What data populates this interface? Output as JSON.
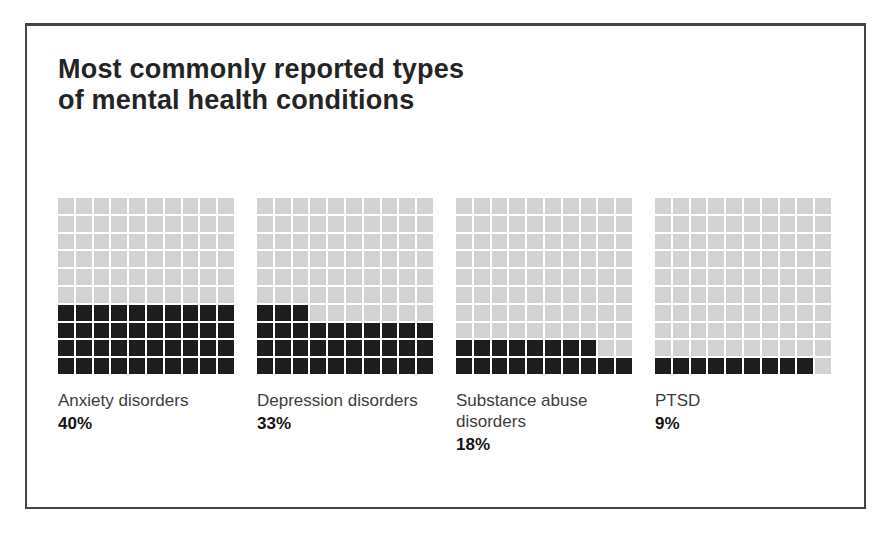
{
  "title": {
    "line1": "Most commonly reported types",
    "line2": "of mental health conditions"
  },
  "chart_data": {
    "type": "waffle",
    "title": "Most commonly reported types of mental health conditions",
    "categories": [
      "Anxiety disorders",
      "Depression disorders",
      "Substance abuse disorders",
      "PTSD"
    ],
    "values": [
      40,
      33,
      18,
      9
    ],
    "unit": "percent",
    "grid": {
      "rows": 10,
      "cols": 10,
      "cell_value": 1,
      "fill_direction": "bottom-up, left-to-right"
    },
    "legend": "none"
  },
  "waffles": [
    {
      "id": "anxiety-disorders",
      "label": "Anxiety disorders",
      "value": 40,
      "value_label": "40%"
    },
    {
      "id": "depression-disorders",
      "label": "Depression disorders",
      "value": 33,
      "value_label": "33%"
    },
    {
      "id": "substance-abuse-disorders",
      "label": "Substance abuse disorders",
      "value": 18,
      "value_label": "18%"
    },
    {
      "id": "ptsd",
      "label": "PTSD",
      "value": 9,
      "value_label": "9%"
    }
  ],
  "colors": {
    "filled_cell": "#1d1d1d",
    "empty_cell": "#d2d2d2",
    "title_text": "#242424",
    "label_text": "#3d3d3d",
    "value_text": "#141414",
    "frame_border": "#444444",
    "background": "#ffffff"
  }
}
